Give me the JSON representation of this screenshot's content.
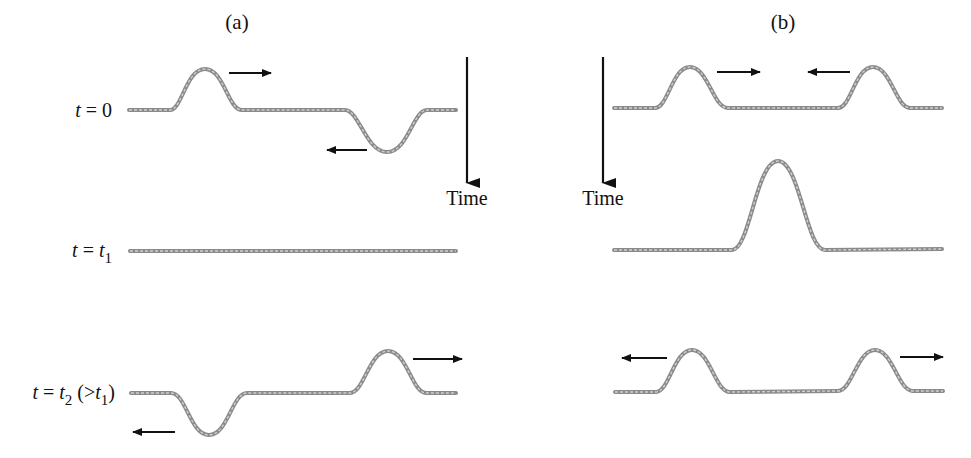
{
  "panels": [
    {
      "id": "a",
      "title": "(a)",
      "time_label": "Time",
      "rows": [
        {
          "label": "t = 0",
          "label_var": "t",
          "label_rest": " = 0",
          "description": "upright pulse moving right, inverted pulse moving left"
        },
        {
          "label": "t = t1",
          "label_var": "t",
          "label_rest": " = ",
          "label_var2": "t",
          "label_sub": "1",
          "description": "pulses cancel; flat string"
        },
        {
          "label": "t = t2 (>t1)",
          "label_var": "t",
          "label_rest": " = ",
          "label_var2": "t",
          "label_sub": "2",
          "label_paren_open": " (>",
          "label_var3": "t",
          "label_sub3": "1",
          "label_paren_close": ")",
          "description": "inverted pulse moving left, upright pulse moving right"
        }
      ]
    },
    {
      "id": "b",
      "title": "(b)",
      "time_label": "Time",
      "rows": [
        {
          "description": "two upright pulses moving toward each other"
        },
        {
          "description": "pulses superpose into a single pulse of double height"
        },
        {
          "description": "two upright pulses moving apart"
        }
      ]
    }
  ],
  "colors": {
    "string": "#8a8a8a",
    "arrow": "#111111",
    "background": "#ffffff"
  }
}
